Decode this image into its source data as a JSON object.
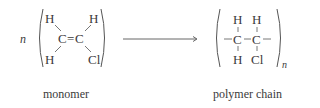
{
  "diagram": {
    "type": "polymerization reaction",
    "monomer": {
      "coefficient": "n",
      "atoms": {
        "h_top_left": "H",
        "h_top_right": "H",
        "c_left": "C",
        "double_bond": "=",
        "c_right": "C",
        "h_bottom_left": "H",
        "cl_bottom_right": "Cl"
      },
      "label": "monomer"
    },
    "arrow": {
      "direction": "right"
    },
    "polymer": {
      "atoms": {
        "h_top_1": "H",
        "h_top_2": "H",
        "c_1": "C",
        "c_2": "C",
        "h_bottom_1": "H",
        "cl_bottom_2": "Cl"
      },
      "bond_left": "–",
      "bond_mid": "–",
      "bond_right": "–",
      "subscript": "n",
      "label": "polymer chain"
    }
  }
}
